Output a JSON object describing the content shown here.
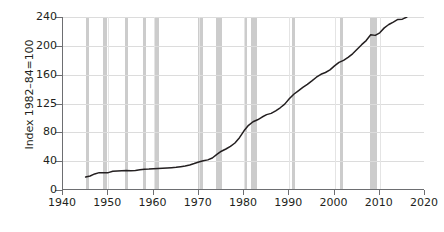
{
  "chart_data": {
    "type": "line",
    "title": "",
    "xlabel": "",
    "ylabel": "Index 1982–84=100",
    "xlim": [
      1940,
      2020
    ],
    "ylim": [
      0,
      240
    ],
    "grid": true,
    "legend": "none",
    "xticks": [
      1940,
      1950,
      1960,
      1970,
      1980,
      1990,
      2000,
      2010,
      2020
    ],
    "yticks": [
      0,
      40,
      80,
      125,
      160,
      200,
      240
    ],
    "ytick_spacing": "even (non-linear printed scale)",
    "series": [
      {
        "name": "Consumer Price Index",
        "color": "#231f20",
        "x": [
          1945,
          1946,
          1947,
          1948,
          1949,
          1950,
          1951,
          1952,
          1953,
          1954,
          1955,
          1956,
          1957,
          1958,
          1959,
          1960,
          1961,
          1962,
          1963,
          1964,
          1965,
          1966,
          1967,
          1968,
          1969,
          1970,
          1971,
          1972,
          1973,
          1974,
          1975,
          1976,
          1977,
          1978,
          1979,
          1980,
          1981,
          1982,
          1983,
          1984,
          1985,
          1986,
          1987,
          1988,
          1989,
          1990,
          1991,
          1992,
          1993,
          1994,
          1995,
          1996,
          1997,
          1998,
          1999,
          2000,
          2001,
          2002,
          2003,
          2004,
          2005,
          2006,
          2007,
          2008,
          2009,
          2010,
          2011,
          2012,
          2013,
          2014,
          2015,
          2016
        ],
        "values": [
          18.0,
          19.5,
          22.3,
          24.1,
          23.8,
          24.1,
          26.0,
          26.5,
          26.7,
          26.9,
          26.8,
          27.2,
          28.1,
          28.9,
          29.1,
          29.6,
          29.9,
          30.2,
          30.6,
          31.0,
          31.5,
          32.4,
          33.4,
          34.8,
          36.7,
          38.8,
          40.5,
          41.8,
          44.4,
          49.3,
          53.8,
          56.9,
          60.6,
          65.2,
          72.6,
          82.4,
          90.9,
          96.5,
          99.6,
          103.9,
          107.6,
          109.6,
          113.6,
          118.3,
          124.0,
          130.7,
          136.2,
          140.3,
          144.5,
          148.2,
          152.4,
          156.9,
          160.5,
          163.0,
          166.6,
          172.2,
          177.1,
          179.9,
          184.0,
          188.9,
          195.3,
          201.6,
          207.3,
          215.3,
          214.5,
          218.1,
          224.9,
          229.6,
          233.0,
          236.7,
          237.0,
          240.0
        ]
      }
    ],
    "recession_bands": [
      {
        "start": 1945.1,
        "end": 1945.8
      },
      {
        "start": 1948.9,
        "end": 1949.8
      },
      {
        "start": 1953.6,
        "end": 1954.4
      },
      {
        "start": 1957.7,
        "end": 1958.4
      },
      {
        "start": 1960.3,
        "end": 1961.2
      },
      {
        "start": 1969.9,
        "end": 1970.9
      },
      {
        "start": 1973.9,
        "end": 1975.2
      },
      {
        "start": 1980.1,
        "end": 1980.6
      },
      {
        "start": 1981.5,
        "end": 1982.9
      },
      {
        "start": 1990.6,
        "end": 1991.2
      },
      {
        "start": 2001.2,
        "end": 2001.9
      },
      {
        "start": 2007.9,
        "end": 2009.5
      }
    ]
  }
}
